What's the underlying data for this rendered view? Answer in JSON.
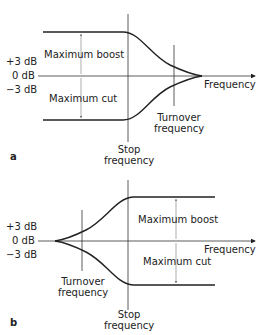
{
  "panels": [
    {
      "id": "a",
      "letter": "a",
      "y_ticks": [
        "+3 dB",
        "0 dB",
        "−3 dB"
      ],
      "boost_label": "Maximum boost",
      "cut_label": "Maximum cut",
      "axis_label": "Frequency",
      "turnover_label_1": "Turnover",
      "turnover_label_2": "frequency",
      "stop_label_1": "Stop",
      "stop_label_2": "frequency"
    },
    {
      "id": "b",
      "letter": "b",
      "y_ticks": [
        "+3 dB",
        "0 dB",
        "−3 dB"
      ],
      "boost_label": "Maximum boost",
      "cut_label": "Maximum cut",
      "axis_label": "Frequency",
      "turnover_label_1": "Turnover",
      "turnover_label_2": "frequency",
      "stop_label_1": "Stop",
      "stop_label_2": "frequency"
    }
  ]
}
